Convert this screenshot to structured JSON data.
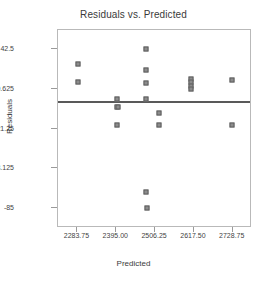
{
  "chart_data": {
    "type": "scatter",
    "title": "Residuals vs. Predicted",
    "xlabel": "Predicted",
    "ylabel": "Residuals",
    "xlim": [
      2228.0,
      2784.0
    ],
    "ylim": [
      -101.0,
      58.0
    ],
    "grid": false,
    "legend": "none",
    "xticks": [
      2283.75,
      2395.0,
      2506.25,
      2617.5,
      2728.75
    ],
    "xtick_labels": [
      "2283.75",
      "2395.00",
      "2506.25",
      "2617.50",
      "2728.75"
    ],
    "yticks": [
      42.5,
      10.625,
      -21.25,
      -53.125,
      -85.0
    ],
    "ytick_labels": [
      "42.5",
      "10.625",
      "-21.25",
      "-53.125",
      "-85"
    ],
    "reference_line": {
      "orientation": "horizontal",
      "y": 0.0,
      "color": "#595959"
    },
    "marker_color": "#8c8c8c",
    "marker_edge_color": "#5e5e5e",
    "points": [
      {
        "x": 2284.2,
        "y": 30.5
      },
      {
        "x": 2284.2,
        "y": 16.0
      },
      {
        "x": 2397.0,
        "y": 2.5
      },
      {
        "x": 2396.0,
        "y": -3.5
      },
      {
        "x": 2399.0,
        "y": -3.5
      },
      {
        "x": 2397.0,
        "y": -18.5
      },
      {
        "x": 2481.0,
        "y": 42.5
      },
      {
        "x": 2481.0,
        "y": 25.5
      },
      {
        "x": 2481.0,
        "y": 15.5
      },
      {
        "x": 2481.0,
        "y": 2.5
      },
      {
        "x": 2481.0,
        "y": -72.0
      },
      {
        "x": 2484.0,
        "y": -85.0
      },
      {
        "x": 2518.0,
        "y": -9.0
      },
      {
        "x": 2518.0,
        "y": -18.5
      },
      {
        "x": 2610.0,
        "y": 18.5
      },
      {
        "x": 2610.0,
        "y": 16.0
      },
      {
        "x": 2610.0,
        "y": 13.0
      },
      {
        "x": 2610.0,
        "y": 10.6
      },
      {
        "x": 2728.0,
        "y": 18.0
      },
      {
        "x": 2728.0,
        "y": -18.5
      }
    ]
  }
}
